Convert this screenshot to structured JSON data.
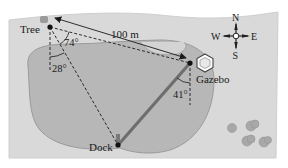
{
  "diagram": {
    "type": "geometry-word-problem-figure",
    "colors": {
      "background": "#ffffff",
      "land": "#d9d9d9",
      "land_edge": "#c8c8c8",
      "lake": "#b7b7b7",
      "lake_edge": "#9a9a9a",
      "dock_path": "#6e6e6e",
      "lines": "#1a1a1a",
      "shrubs": "#a8a8a8"
    },
    "points": {
      "tree": {
        "label": "Tree"
      },
      "gazebo": {
        "label": "Gazebo"
      },
      "dock": {
        "label": "Dock"
      }
    },
    "measurements": {
      "tree_to_gazebo": "100 m",
      "angle_at_tree_between_gazebo_and_dock": "74°",
      "angle_at_tree_from_south": "28°",
      "angle_at_gazebo_from_south": "41°"
    },
    "compass": {
      "north": "N",
      "south": "S",
      "east": "E",
      "west": "W"
    }
  }
}
